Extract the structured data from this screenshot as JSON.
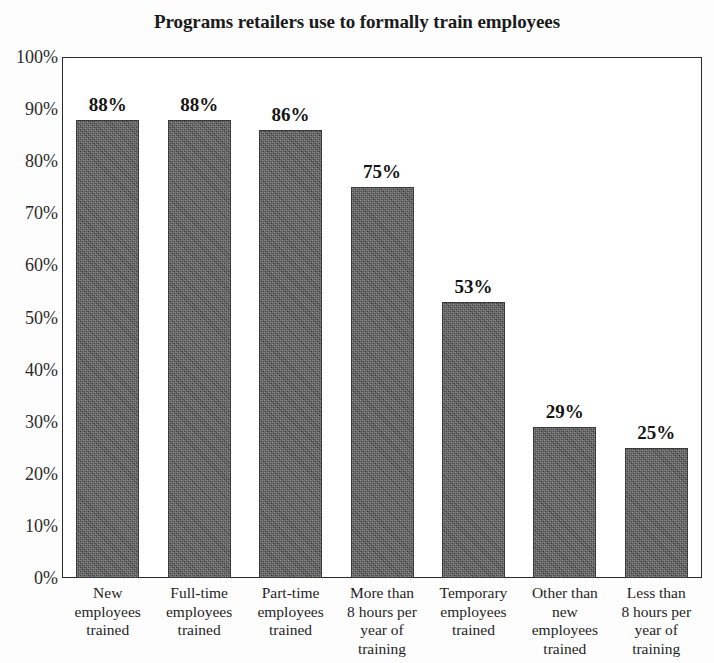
{
  "chart_data": {
    "type": "bar",
    "title": "Programs retailers use to formally train employees",
    "xlabel": "",
    "ylabel": "",
    "ylim": [
      0,
      100
    ],
    "grid": false,
    "legend": null,
    "y_tick_labels": [
      "100%",
      "90%",
      "80%",
      "70%",
      "60%",
      "50%",
      "40%",
      "30%",
      "20%",
      "10%",
      "0%"
    ],
    "y_ticks": [
      100,
      90,
      80,
      70,
      60,
      50,
      40,
      30,
      20,
      10,
      0
    ],
    "categories": [
      "New employees trained",
      "Full-time employees trained",
      "Part-time employees trained",
      "More than 8 hours per year of training",
      "Temporary employees trained",
      "Other than new employees trained",
      "Less than 8 hours per year of training"
    ],
    "category_label_lines": [
      [
        "New",
        "employees",
        "trained"
      ],
      [
        "Full-time",
        "employees",
        "trained"
      ],
      [
        "Part-time",
        "employees",
        "trained"
      ],
      [
        "More than",
        "8 hours per",
        "year of",
        "training"
      ],
      [
        "Temporary",
        "employees",
        "trained"
      ],
      [
        "Other than",
        "new",
        "employees",
        "trained"
      ],
      [
        "Less than",
        "8 hours per",
        "year of",
        "training"
      ]
    ],
    "values": [
      88,
      88,
      86,
      75,
      53,
      29,
      25
    ],
    "value_labels": [
      "88%",
      "88%",
      "86%",
      "75%",
      "53%",
      "29%",
      "25%"
    ],
    "colors": {
      "bar_fill": "#4e4e4e",
      "bar_edge": "#3a3a3a",
      "axis": "#2a2a2a",
      "text": "#1a1a1a",
      "background": "#fdfdfd"
    }
  }
}
